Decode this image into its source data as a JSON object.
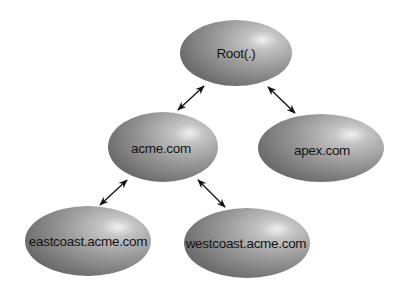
{
  "diagram": {
    "type": "tree",
    "nodes": [
      {
        "id": "root",
        "label": "Root(.)",
        "cx": 236,
        "cy": 53,
        "rx": 56,
        "ry": 33
      },
      {
        "id": "acme",
        "label": "acme.com",
        "cx": 163,
        "cy": 147,
        "rx": 55,
        "ry": 35
      },
      {
        "id": "apex",
        "label": "apex.com",
        "cx": 321,
        "cy": 148,
        "rx": 63,
        "ry": 34
      },
      {
        "id": "eastcoast",
        "label": "eastcoast.acme.com",
        "cx": 88,
        "cy": 241,
        "rx": 63,
        "ry": 35
      },
      {
        "id": "westcoast",
        "label": "westcoast.acme.com",
        "cx": 247,
        "cy": 243,
        "rx": 63,
        "ry": 35
      }
    ],
    "edges": [
      {
        "from": "root",
        "to": "acme",
        "direction": "bidirectional",
        "x1": 204,
        "y1": 86,
        "x2": 178,
        "y2": 110
      },
      {
        "from": "root",
        "to": "apex",
        "direction": "bidirectional",
        "x1": 268,
        "y1": 87,
        "x2": 295,
        "y2": 113
      },
      {
        "from": "acme",
        "to": "eastcoast",
        "direction": "bidirectional",
        "x1": 127,
        "y1": 180,
        "x2": 100,
        "y2": 205
      },
      {
        "from": "acme",
        "to": "westcoast",
        "direction": "bidirectional",
        "x1": 198,
        "y1": 180,
        "x2": 225,
        "y2": 207
      }
    ],
    "colors": {
      "node_highlight": "#ececec",
      "node_mid": "#a8a8a8",
      "node_edge": "#6e6e6e",
      "arrow": "#111111",
      "label": "#141414",
      "background": "#ffffff"
    }
  }
}
